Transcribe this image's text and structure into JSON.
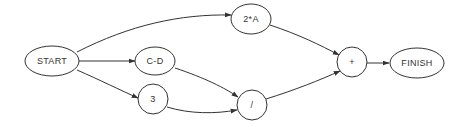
{
  "diagram": {
    "type": "dataflow-graph",
    "colors": {
      "stroke": "#333333",
      "text": "#333333",
      "background": "#ffffff"
    },
    "nodes": [
      {
        "id": "start",
        "label": "START",
        "shape": "ellipse",
        "cx": 52,
        "cy": 61,
        "rx": 27,
        "ry": 15
      },
      {
        "id": "cd",
        "label": "C-D",
        "shape": "ellipse",
        "cx": 155,
        "cy": 61,
        "rx": 20,
        "ry": 14
      },
      {
        "id": "three",
        "label": "3",
        "shape": "ellipse",
        "cx": 153,
        "cy": 99,
        "rx": 15,
        "ry": 15
      },
      {
        "id": "twoA",
        "label": "2*A",
        "shape": "ellipse",
        "cx": 251,
        "cy": 19,
        "rx": 20,
        "ry": 15
      },
      {
        "id": "div",
        "label": "/",
        "shape": "ellipse",
        "cx": 252,
        "cy": 105,
        "rx": 15,
        "ry": 15
      },
      {
        "id": "plus",
        "label": "+",
        "shape": "ellipse",
        "cx": 352,
        "cy": 62,
        "rx": 15,
        "ry": 15
      },
      {
        "id": "finish",
        "label": "FINISH",
        "shape": "ellipse",
        "cx": 417,
        "cy": 63,
        "rx": 27,
        "ry": 15
      }
    ],
    "edges": [
      {
        "from": "START",
        "to": "2*A",
        "path": "M 77 52 C 130 25, 180 14, 231 15"
      },
      {
        "from": "START",
        "to": "C-D",
        "path": "M 79 61 L 135 61"
      },
      {
        "from": "START",
        "to": "3",
        "path": "M 77 70 C 100 80, 120 90, 138 98"
      },
      {
        "from": "C-D",
        "to": "/",
        "path": "M 175 68 C 205 78, 225 88, 238 97"
      },
      {
        "from": "3",
        "to": "/",
        "path": "M 167 107 C 190 114, 215 114, 237 110"
      },
      {
        "from": "2*A",
        "to": "+",
        "path": "M 270 25 C 300 35, 320 45, 339 55"
      },
      {
        "from": "/",
        "to": "+",
        "path": "M 266 99 C 295 90, 320 80, 340 71"
      },
      {
        "from": "+",
        "to": "FINISH",
        "path": "M 367 63 L 389 63"
      }
    ]
  }
}
